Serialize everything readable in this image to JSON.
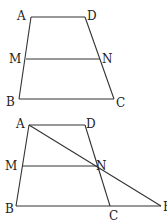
{
  "figure1": {
    "labels": {
      "A": "A",
      "D": "D",
      "M": "M",
      "N": "N",
      "B": "B",
      "C": "C"
    },
    "points": {
      "A": [
        31,
        17
      ],
      "D": [
        85,
        17
      ],
      "M": [
        26,
        59
      ],
      "N": [
        100,
        59
      ],
      "B": [
        19,
        99
      ],
      "C": [
        114,
        99
      ]
    }
  },
  "figure2": {
    "labels": {
      "A": "A",
      "D": "D",
      "M": "M",
      "N": "N",
      "B": "B",
      "C": "C",
      "E": "E"
    },
    "points": {
      "A": [
        29,
        125
      ],
      "D": [
        85,
        125
      ],
      "M": [
        22,
        166
      ],
      "N": [
        97,
        166
      ],
      "B": [
        16,
        206
      ],
      "C": [
        110,
        206
      ],
      "E": [
        161,
        206
      ]
    }
  }
}
